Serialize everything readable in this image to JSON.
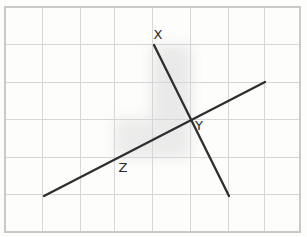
{
  "figure": {
    "canvas": {
      "width": 307,
      "height": 237
    },
    "background_color": "#ffffff",
    "paper_tint": "#fdfdfc"
  },
  "grid": {
    "line_color": "#d6d6d6",
    "border_color": "#c9c9c9",
    "columns": 8,
    "rows": 6,
    "left": 5,
    "top": 7,
    "right": 300,
    "bottom": 232,
    "x_positions": [
      5,
      42.9,
      80.8,
      114.8,
      152.7,
      190.6,
      228.5,
      264.5,
      300
    ],
    "y_positions": [
      7,
      44.5,
      82,
      119.5,
      157,
      194.5,
      232
    ]
  },
  "lines": [
    {
      "id": "line-xy",
      "name": "line-x",
      "stroke": "#2e2e2e",
      "width": 2.3,
      "x1": 154,
      "y1": 45,
      "x2": 229,
      "y2": 196
    },
    {
      "id": "line-z",
      "name": "line-z",
      "stroke": "#2e2e2e",
      "width": 2.3,
      "x1": 44,
      "y1": 196,
      "x2": 265,
      "y2": 82
    }
  ],
  "intersection": {
    "label": "Y",
    "x": 192,
    "y": 120
  },
  "labels": [
    {
      "id": "label-x",
      "text": "X",
      "x": 158,
      "y": 39,
      "anchor": "middle"
    },
    {
      "id": "label-y",
      "text": "Y",
      "x": 199,
      "y": 130,
      "anchor": "middle"
    },
    {
      "id": "label-z",
      "text": "Z",
      "x": 123,
      "y": 172,
      "anchor": "middle"
    }
  ],
  "shading": [
    {
      "id": "shade-upper",
      "x": 152,
      "y": 45,
      "width": 39,
      "height": 75,
      "color": "#d9d9d9",
      "opacity": 0.55
    },
    {
      "id": "shade-lower",
      "x": 115,
      "y": 119,
      "width": 76,
      "height": 39,
      "color": "#d9d9d9",
      "opacity": 0.5
    }
  ]
}
